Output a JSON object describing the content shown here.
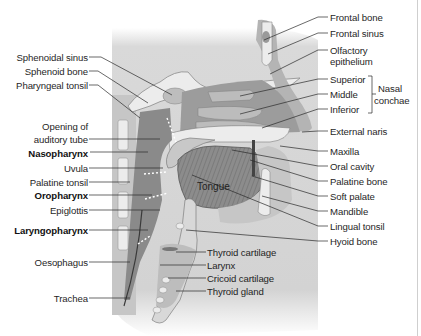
{
  "figure": {
    "title_cropped": "",
    "colors": {
      "background": "#ffffff",
      "tissue_light": "#d6d6d6",
      "tissue_mid": "#a8a8a8",
      "tissue_dark": "#6e6e6e",
      "bone": "#e9e9e9",
      "airway": "#8a8a8a",
      "leader_line": "#2a2a2a",
      "divider": "#cfcfcf"
    },
    "center_label": "Tongue",
    "left_labels": [
      {
        "text": "Sphenoidal sinus",
        "bold": false
      },
      {
        "text": "Sphenoid bone",
        "bold": false
      },
      {
        "text": "Pharyngeal tonsil",
        "bold": false
      },
      {
        "text": "Opening of",
        "bold": false
      },
      {
        "text": "auditory tube",
        "bold": false
      },
      {
        "text": "Nasopharynx",
        "bold": true
      },
      {
        "text": "Uvula",
        "bold": false
      },
      {
        "text": "Palatine tonsil",
        "bold": false
      },
      {
        "text": "Oropharynx",
        "bold": true
      },
      {
        "text": "Epiglottis",
        "bold": false
      },
      {
        "text": "Laryngopharynx",
        "bold": true
      },
      {
        "text": "Oesophagus",
        "bold": false
      },
      {
        "text": "Trachea",
        "bold": false
      }
    ],
    "right_labels": [
      {
        "text": "Frontal bone"
      },
      {
        "text": "Frontal sinus"
      },
      {
        "text": "Olfactory"
      },
      {
        "text": "epithelium"
      },
      {
        "text": "Superior"
      },
      {
        "text": "Middle"
      },
      {
        "text": "Inferior"
      },
      {
        "text": "External naris"
      },
      {
        "text": "Maxilla"
      },
      {
        "text": "Oral cavity"
      },
      {
        "text": "Palatine bone"
      },
      {
        "text": "Soft palate"
      },
      {
        "text": "Mandible"
      },
      {
        "text": "Lingual tonsil"
      },
      {
        "text": "Hyoid bone"
      }
    ],
    "bracket_label": [
      "Nasal",
      "conchae"
    ],
    "bottom_labels": [
      {
        "text": "Thyroid cartilage"
      },
      {
        "text": "Larynx"
      },
      {
        "text": "Cricoid cartilage"
      },
      {
        "text": "Thyroid gland"
      }
    ]
  }
}
